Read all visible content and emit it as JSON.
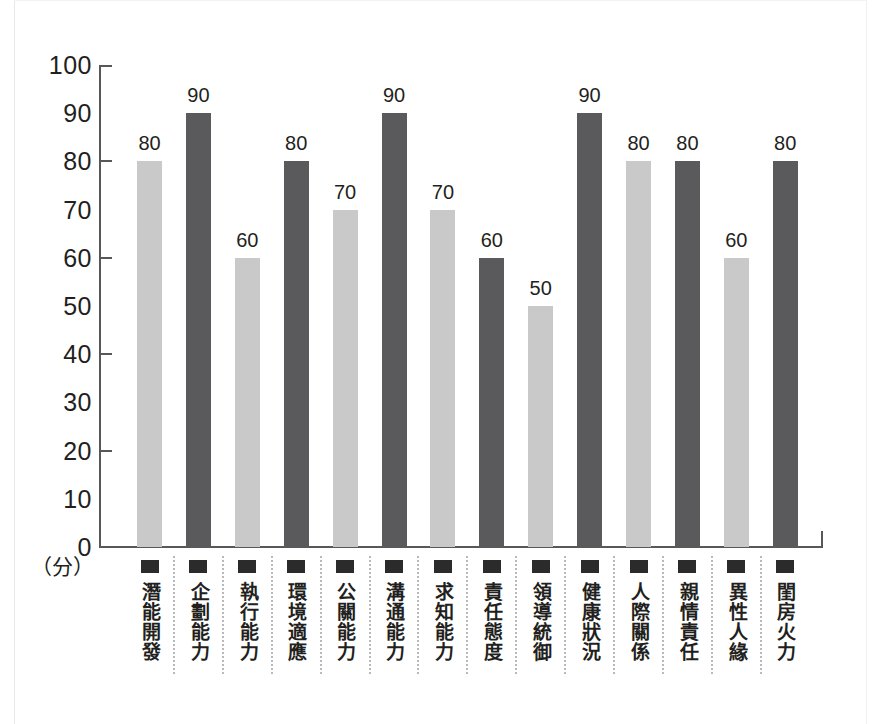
{
  "chart_data": {
    "type": "bar",
    "title": "",
    "subtitle": "",
    "xlabel": "",
    "ylabel": "（分）",
    "ylim": [
      0,
      100
    ],
    "ytick_labels": [
      "100",
      "90",
      "80",
      "70",
      "60",
      "50",
      "40",
      "30",
      "20",
      "10",
      "0"
    ],
    "ytick_values": [
      100,
      90,
      80,
      70,
      60,
      50,
      40,
      30,
      20,
      10,
      0
    ],
    "ymajor_ticks": [
      100,
      80,
      60,
      40,
      20,
      0
    ],
    "grid": false,
    "legend": "none",
    "categories": [
      "潛能開發",
      "企劃能力",
      "執行能力",
      "環境適應",
      "公關能力",
      "溝通能力",
      "求知能力",
      "責任態度",
      "領導統御",
      "健康狀況",
      "人際關係",
      "親情責任",
      "異性人緣",
      "閨房火力"
    ],
    "values": [
      80,
      90,
      60,
      80,
      70,
      90,
      70,
      60,
      50,
      90,
      80,
      80,
      60,
      80
    ],
    "data_labels": [
      "80",
      "90",
      "60",
      "80",
      "70",
      "90",
      "70",
      "60",
      "50",
      "90",
      "80",
      "80",
      "60",
      "80"
    ],
    "bar_colors": [
      "#c9c9c9",
      "#5a5a5c",
      "#c9c9c9",
      "#5a5a5c",
      "#c9c9c9",
      "#5a5a5c",
      "#c9c9c9",
      "#5a5a5c",
      "#c9c9c9",
      "#5a5a5c",
      "#c9c9c9",
      "#5a5a5c",
      "#c9c9c9",
      "#5a5a5c"
    ],
    "colors": {
      "light_bar": "#c9c9c9",
      "dark_bar": "#5a5a5c",
      "axis": "#58585a",
      "text": "#231f20",
      "separator": "#b9b9b9",
      "background": "#ffffff"
    },
    "category_marker": "filled-square"
  }
}
